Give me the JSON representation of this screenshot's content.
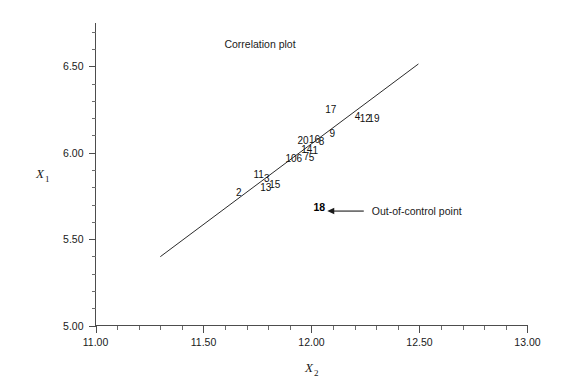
{
  "chart_data": {
    "type": "scatter",
    "title": "Correlation plot",
    "xlabel": "X2",
    "ylabel": "X1",
    "xlabel_base": "X",
    "xlabel_sub": "2",
    "ylabel_base": "X",
    "ylabel_sub": "1",
    "xlim": [
      11.0,
      13.0
    ],
    "ylim": [
      5.0,
      6.75
    ],
    "xticks": [
      11.0,
      11.5,
      12.0,
      12.5,
      13.0
    ],
    "xtick_labels": [
      "11.00",
      "11.50",
      "12.00",
      "12.50",
      "13.00"
    ],
    "yticks": [
      5.0,
      5.5,
      6.0,
      6.5
    ],
    "ytick_labels": [
      "5.00",
      "5.50",
      "6.00",
      "6.50"
    ],
    "x_minor_step": 0.1,
    "y_minor_step": 0.1,
    "grid": false,
    "legend": "none",
    "series": [
      {
        "name": "observations",
        "marker": "label-only",
        "points": [
          {
            "label": "2",
            "x": 11.663,
            "y": 5.752
          },
          {
            "label": "11",
            "x": 11.755,
            "y": 5.855
          },
          {
            "label": "3",
            "x": 11.793,
            "y": 5.828
          },
          {
            "label": "13",
            "x": 11.788,
            "y": 5.779
          },
          {
            "label": "15",
            "x": 11.83,
            "y": 5.793
          },
          {
            "label": "10",
            "x": 11.905,
            "y": 5.948
          },
          {
            "label": "6",
            "x": 11.944,
            "y": 5.944
          },
          {
            "label": "7",
            "x": 11.976,
            "y": 5.958
          },
          {
            "label": "5",
            "x": 12.0,
            "y": 5.951
          },
          {
            "label": "14",
            "x": 11.978,
            "y": 6.0
          },
          {
            "label": "1",
            "x": 12.018,
            "y": 5.993
          },
          {
            "label": "20",
            "x": 11.961,
            "y": 6.048
          },
          {
            "label": "16",
            "x": 12.014,
            "y": 6.058
          },
          {
            "label": "8",
            "x": 12.047,
            "y": 6.044
          },
          {
            "label": "9",
            "x": 12.096,
            "y": 6.089
          },
          {
            "label": "17",
            "x": 12.089,
            "y": 6.229
          },
          {
            "label": "4",
            "x": 12.213,
            "y": 6.19
          },
          {
            "label": "12",
            "x": 12.249,
            "y": 6.175
          },
          {
            "label": "19",
            "x": 12.289,
            "y": 6.175
          }
        ]
      },
      {
        "name": "out-of-control",
        "marker": "label-bold",
        "points": [
          {
            "label": "18",
            "x": 12.036,
            "y": 5.66
          }
        ]
      }
    ],
    "fit_line": {
      "name": "correlation line",
      "x_start": 11.3,
      "y_start": 5.398,
      "x_end": 12.495,
      "y_end": 6.513
    },
    "annotations": [
      {
        "name": "out-of-control-annotation",
        "text": "Out-of-control point",
        "arrow_from_x": 12.242,
        "arrow_to_x": 12.073,
        "arrow_y": 5.662
      }
    ]
  },
  "colors": {
    "background": "#ffffff",
    "axis": "#4d4d4d",
    "line": "#2b2b2b",
    "text": "#1a1a1a",
    "highlight": "#000000"
  }
}
